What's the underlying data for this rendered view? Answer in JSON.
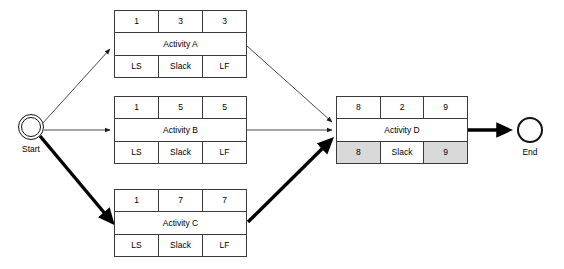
{
  "diagram": {
    "type": "activity-on-node network",
    "colors": {
      "line": "#3a3a3a",
      "bold_line": "#000000",
      "shaded_cell": "#d9d9d9",
      "background": "#ffffff"
    }
  },
  "terminals": {
    "start": {
      "label": "Start",
      "shape": "double-circle"
    },
    "end": {
      "label": "End",
      "shape": "circle"
    }
  },
  "nodes": [
    {
      "id": "activity-a",
      "name": "Activity A",
      "top_row": [
        "1",
        "3",
        "3"
      ],
      "bottom_row": [
        "LS",
        "Slack",
        "LF"
      ],
      "bottom_shaded": [
        false,
        false,
        false
      ],
      "on_critical_path": false
    },
    {
      "id": "activity-b",
      "name": "Activity B",
      "top_row": [
        "1",
        "5",
        "5"
      ],
      "bottom_row": [
        "LS",
        "Slack",
        "LF"
      ],
      "bottom_shaded": [
        false,
        false,
        false
      ],
      "on_critical_path": false
    },
    {
      "id": "activity-c",
      "name": "Activity C",
      "top_row": [
        "1",
        "7",
        "7"
      ],
      "bottom_row": [
        "LS",
        "Slack",
        "LF"
      ],
      "bottom_shaded": [
        false,
        false,
        false
      ],
      "on_critical_path": true
    },
    {
      "id": "activity-d",
      "name": "Activity D",
      "top_row": [
        "8",
        "2",
        "9"
      ],
      "bottom_row": [
        "8",
        "Slack",
        "9"
      ],
      "bottom_shaded": [
        true,
        false,
        true
      ],
      "on_critical_path": true
    }
  ],
  "edges": [
    {
      "from": "Start",
      "to": "Activity A",
      "bold": false
    },
    {
      "from": "Start",
      "to": "Activity B",
      "bold": false
    },
    {
      "from": "Start",
      "to": "Activity C",
      "bold": true
    },
    {
      "from": "Activity A",
      "to": "Activity D",
      "bold": false
    },
    {
      "from": "Activity B",
      "to": "Activity D",
      "bold": false
    },
    {
      "from": "Activity C",
      "to": "Activity D",
      "bold": true
    },
    {
      "from": "Activity D",
      "to": "End",
      "bold": true
    }
  ]
}
